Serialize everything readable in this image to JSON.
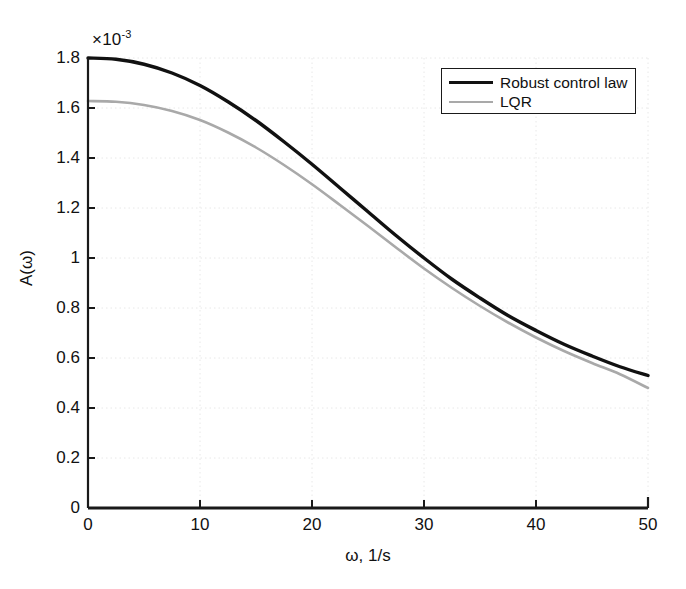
{
  "chart_data": {
    "type": "line",
    "title": "",
    "xlabel": "ω, 1/s",
    "ylabel": "A(ω)",
    "y_multiplier_text": "×10",
    "y_multiplier_exponent": "-3",
    "y_scale": 0.001,
    "xlim": [
      0,
      50
    ],
    "ylim": [
      0,
      1.8
    ],
    "xticks": [
      0,
      10,
      20,
      30,
      40,
      50
    ],
    "xtick_labels": [
      "0",
      "10",
      "20",
      "30",
      "40",
      "50"
    ],
    "yticks": [
      0,
      0.2,
      0.4,
      0.6,
      0.8,
      1,
      1.2,
      1.4,
      1.6,
      1.8
    ],
    "ytick_labels": [
      "0",
      "0.2",
      "0.4",
      "0.6",
      "0.8",
      "1",
      "1.2",
      "1.4",
      "1.6",
      "1.8"
    ],
    "grid": true,
    "legend_position": "upper-right",
    "colors": {
      "robust": "#111111",
      "lqr": "#a9a9a9",
      "axis": "#1a1a1a",
      "grid": "#e8e8e8",
      "background": "#ffffff"
    },
    "x": [
      0,
      2.5,
      5,
      7.5,
      10,
      12.5,
      15,
      17.5,
      20,
      22.5,
      25,
      27.5,
      30,
      32.5,
      35,
      37.5,
      40,
      42.5,
      45,
      47.5,
      50
    ],
    "series": [
      {
        "name": "Robust control law",
        "color": "#111111",
        "linewidth": 3.4,
        "values": [
          1.8,
          1.795,
          1.775,
          1.74,
          1.69,
          1.625,
          1.55,
          1.465,
          1.375,
          1.28,
          1.185,
          1.09,
          1.0,
          0.915,
          0.84,
          0.77,
          0.71,
          0.655,
          0.608,
          0.565,
          0.53
        ]
      },
      {
        "name": "LQR",
        "color": "#a9a9a9",
        "linewidth": 2.6,
        "values": [
          1.628,
          1.625,
          1.612,
          1.588,
          1.552,
          1.502,
          1.442,
          1.372,
          1.295,
          1.212,
          1.128,
          1.042,
          0.958,
          0.88,
          0.808,
          0.742,
          0.682,
          0.628,
          0.58,
          0.535,
          0.48
        ]
      }
    ],
    "legend": [
      {
        "label": "Robust control law",
        "swatch": "black"
      },
      {
        "label": "LQR",
        "swatch": "gray"
      }
    ]
  }
}
